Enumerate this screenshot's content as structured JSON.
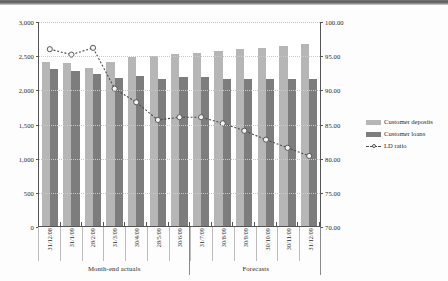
{
  "chart_data": {
    "type": "bar",
    "title": "",
    "xlabel": "",
    "ylabel": "",
    "grid": true,
    "legend_position": "right",
    "categories": [
      "31/12/08",
      "31/1/09",
      "28/2/09",
      "31/3/09",
      "30/4/09",
      "28/5/09",
      "30/6/09",
      "31/7/09",
      "30/8/09",
      "30/9/09",
      "30/10/09",
      "30/11/09",
      "31/12/09"
    ],
    "group_labels": [
      {
        "label": "Month-end actuals",
        "span": 7
      },
      {
        "label": "Forecasts",
        "span": 6
      }
    ],
    "series": [
      {
        "name": "Customer deposits",
        "axis": "left",
        "kind": "bar",
        "color": "#b6b6b6",
        "values": [
          2405,
          2385,
          2310,
          2400,
          2480,
          2495,
          2520,
          2535,
          2560,
          2585,
          2610,
          2640,
          2665
        ]
      },
      {
        "name": "Customer loans",
        "axis": "left",
        "kind": "bar",
        "color": "#7d7d7d",
        "values": [
          2300,
          2270,
          2220,
          2165,
          2200,
          2150,
          2185,
          2185,
          2150,
          2150,
          2150,
          2150,
          2150
        ]
      },
      {
        "name": "LD ratio",
        "axis": "right",
        "kind": "line",
        "color": "#4a4a4a",
        "marker": "open-circle",
        "values": [
          96.0,
          95.2,
          96.2,
          90.2,
          88.2,
          85.6,
          86.0,
          86.0,
          85.1,
          84.0,
          82.7,
          81.5,
          80.3
        ]
      }
    ],
    "left_axis": {
      "min": 0,
      "max": 3000,
      "step": 500,
      "ticks": [
        "0",
        "500",
        "1,000",
        "1,500",
        "2,000",
        "2,500",
        "3,000"
      ]
    },
    "right_axis": {
      "min": 70,
      "max": 100,
      "step": 5,
      "ticks": [
        "70.00",
        "75.00",
        "80.00",
        "85.00",
        "90.00",
        "95.00",
        "100.00"
      ]
    }
  }
}
